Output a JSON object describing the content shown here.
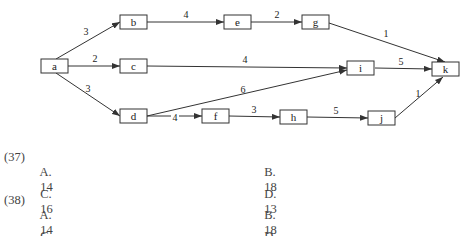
{
  "diagram": {
    "type": "activity-network",
    "nodes": [
      {
        "id": "a",
        "label": "a"
      },
      {
        "id": "b",
        "label": "b"
      },
      {
        "id": "c",
        "label": "c"
      },
      {
        "id": "d",
        "label": "d"
      },
      {
        "id": "e",
        "label": "e"
      },
      {
        "id": "f",
        "label": "f"
      },
      {
        "id": "g",
        "label": "g"
      },
      {
        "id": "h",
        "label": "h"
      },
      {
        "id": "i",
        "label": "i"
      },
      {
        "id": "j",
        "label": "j"
      },
      {
        "id": "k",
        "label": "k"
      }
    ],
    "edges": [
      {
        "from": "a",
        "to": "b",
        "weight": "3"
      },
      {
        "from": "a",
        "to": "c",
        "weight": "2"
      },
      {
        "from": "a",
        "to": "d",
        "weight": "3"
      },
      {
        "from": "b",
        "to": "e",
        "weight": "4"
      },
      {
        "from": "e",
        "to": "g",
        "weight": "2"
      },
      {
        "from": "g",
        "to": "k",
        "weight": "1"
      },
      {
        "from": "c",
        "to": "i",
        "weight": "4"
      },
      {
        "from": "d",
        "to": "i",
        "weight": "6"
      },
      {
        "from": "i",
        "to": "k",
        "weight": "5"
      },
      {
        "from": "d",
        "to": "f",
        "weight": "4"
      },
      {
        "from": "f",
        "to": "h",
        "weight": "3"
      },
      {
        "from": "h",
        "to": "j",
        "weight": "5"
      },
      {
        "from": "j",
        "to": "k",
        "weight": "1"
      }
    ]
  },
  "questions": [
    {
      "number": "(37)",
      "options": [
        {
          "letter": "A.",
          "value": "14"
        },
        {
          "letter": "B.",
          "value": "18"
        },
        {
          "letter": "C.",
          "value": "16"
        },
        {
          "letter": "D.",
          "value": "13"
        }
      ]
    },
    {
      "number": "(38)",
      "options": [
        {
          "letter": "A.",
          "value": "14"
        },
        {
          "letter": "B.",
          "value": "18"
        },
        {
          "letter": "C.",
          "value": "16"
        },
        {
          "letter": "D.",
          "value": "17"
        }
      ]
    }
  ]
}
